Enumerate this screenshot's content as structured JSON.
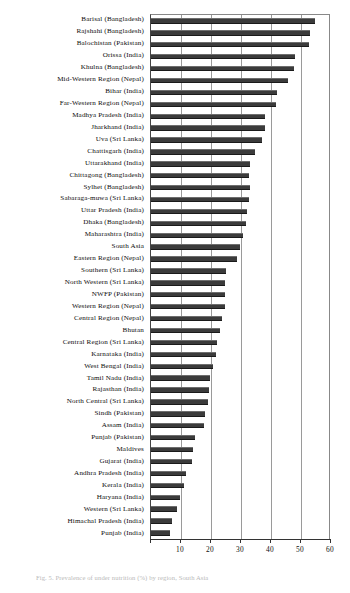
{
  "chart_data": {
    "type": "bar",
    "orientation": "horizontal",
    "title": "",
    "xlabel": "",
    "ylabel": "",
    "xlim": [
      0,
      60
    ],
    "xticks": [
      0,
      10,
      20,
      30,
      40,
      50,
      60
    ],
    "grid": true,
    "legend": "none",
    "series_name": "",
    "bar_color": "#3b3b3b",
    "categories": [
      "Barisal (Bangladesh)",
      "Rajshahi (Bangladesh)",
      "Balochistan (Pakistan)",
      "Orissa (India)",
      "Khulna (Bangladesh)",
      "Mid-Western Region (Nepal)",
      "Bihar (India)",
      "Far-Western Region (Nepal)",
      "Madhya Pradesh (India)",
      "Jharkhand (India)",
      "Uva (Sri Lanka)",
      "Chattisgarh (India)",
      "Uttarakhand (India)",
      "Chittagong (Bangladesh)",
      "Sylhet (Bangladesh)",
      "Sabaraga-muwa (Sri Lanka)",
      "Uttar Pradesh (India)",
      "Dhaka (Bangladesh)",
      "Maharashtra (India)",
      "South Asia",
      "Eastern Region (Nepal)",
      "Southern (Sri Lanka)",
      "North Western (Sri Lanka)",
      "NWFP (Pakistan)",
      "Western Region (Nepal)",
      "Central Region (Nepal)",
      "Bhutan",
      "Central Region (Sri Lanka)",
      "Karnataka (India)",
      "West Bengal (India)",
      "Tamil Nadu (India)",
      "Rajasthan (India)",
      "North Central (Sri Lanka)",
      "Sindh (Pakistan)",
      "Assam (India)",
      "Punjab (Pakistan)",
      "Maldives",
      "Gujarat (India)",
      "Andhra Pradesh (India)",
      "Kerala (India)",
      "Haryana (India)",
      "Western (Sri Lanka)",
      "Himachal Pradesh (India)",
      "Punjab (India)"
    ],
    "values": [
      54.5,
      53.0,
      52.8,
      48.0,
      47.5,
      45.5,
      42.0,
      41.5,
      38.0,
      38.0,
      37.0,
      34.5,
      33.0,
      32.5,
      33.0,
      32.5,
      32.0,
      31.5,
      30.5,
      29.5,
      28.5,
      25.0,
      24.8,
      24.8,
      24.5,
      23.8,
      23.0,
      22.0,
      21.5,
      20.5,
      19.5,
      19.2,
      19.0,
      18.0,
      17.5,
      14.5,
      14.0,
      13.5,
      11.5,
      11.0,
      9.5,
      8.5,
      7.0,
      6.2
    ]
  },
  "axis": {
    "tick_labels": [
      "0",
      "10",
      "20",
      "30",
      "40",
      "50",
      "60"
    ]
  },
  "caption": {
    "figure_number": "Fig. 5.",
    "text": "Fig. 5.  Prevalence of under nutrition (%) by region, South Asia"
  }
}
